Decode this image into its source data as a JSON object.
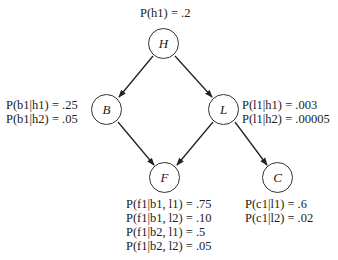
{
  "nodes": {
    "H": {
      "label": "H",
      "cx": 164,
      "cy": 44
    },
    "B": {
      "label": "B",
      "cx": 107,
      "cy": 110
    },
    "L": {
      "label": "L",
      "cx": 224,
      "cy": 110
    },
    "F": {
      "label": "F",
      "cx": 165,
      "cy": 178
    },
    "C": {
      "label": "C",
      "cx": 278,
      "cy": 178
    }
  },
  "edges": [
    {
      "from": "H",
      "to": "B"
    },
    {
      "from": "H",
      "to": "L"
    },
    {
      "from": "B",
      "to": "F"
    },
    {
      "from": "L",
      "to": "F"
    },
    {
      "from": "L",
      "to": "C"
    }
  ],
  "probabilities": {
    "H": [
      "P(h1) = .2"
    ],
    "B": [
      "P(b1|h1) = .25",
      "P(b1|h2) = .05"
    ],
    "L": [
      "P(l1|h1) = .003",
      "P(l1|h2) = .00005"
    ],
    "F": [
      "P(f1|b1, l1) = .75",
      "P(f1|b1, l2) = .10",
      "P(f1|b2, l1) = .5",
      "P(f1|b2, l2) = .05"
    ],
    "C": [
      "P(c1|l1) = .6",
      "P(c1|l2) = .02"
    ]
  }
}
